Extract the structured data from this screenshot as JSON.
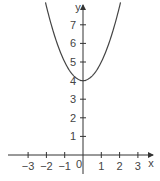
{
  "chart_data": {
    "type": "line",
    "title": "",
    "xlabel": "x",
    "ylabel": "y",
    "function": "y = x^2 + 4",
    "xlim": [
      -3.5,
      4
    ],
    "ylim": [
      -1,
      8.5
    ],
    "x_ticks": [
      -3,
      -2,
      -1,
      0,
      1,
      2,
      3
    ],
    "x_tick_labels": [
      "−3",
      "−2",
      "−1",
      "0",
      "1",
      "2",
      "3"
    ],
    "y_ticks": [
      1,
      2,
      3,
      4,
      5,
      6,
      7
    ],
    "y_tick_labels": [
      "1",
      "2",
      "3",
      "4",
      "5",
      "6",
      "7"
    ],
    "origin_label": "0",
    "grid": false,
    "legend": null,
    "series": [
      {
        "name": "parabola",
        "x": [
          -2.0,
          -1.5,
          -1.0,
          -0.5,
          0,
          0.5,
          1.0,
          1.5,
          2.0
        ],
        "y": [
          8.0,
          6.25,
          5.0,
          4.25,
          4.0,
          4.25,
          5.0,
          6.25,
          8.0
        ]
      }
    ],
    "vertex": [
      0,
      4
    ],
    "colors": {
      "axis": "#333333",
      "curve": "#444444",
      "text": "#444444"
    }
  }
}
